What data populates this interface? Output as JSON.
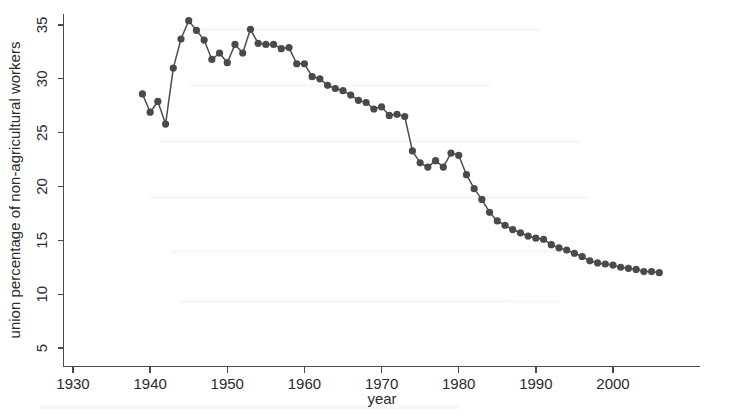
{
  "chart_data": {
    "type": "line",
    "title": "",
    "subtitle": "",
    "xlabel": "year",
    "ylabel": "union percentage of non-agricultural workers",
    "xlim": [
      1927,
      2008
    ],
    "ylim": [
      3.5,
      36.5
    ],
    "xticks": [
      1930,
      1940,
      1950,
      1960,
      1970,
      1980,
      1990,
      2000
    ],
    "yticks": [
      5,
      10,
      15,
      20,
      25,
      30,
      35
    ],
    "grid": false,
    "legend": null,
    "markers": "filled-circle",
    "marker_color": "#4a4a4a",
    "line_color": "#4d4d4d",
    "x": [
      1939,
      1940,
      1941,
      1942,
      1943,
      1944,
      1945,
      1946,
      1947,
      1948,
      1949,
      1950,
      1951,
      1952,
      1953,
      1954,
      1955,
      1956,
      1957,
      1958,
      1959,
      1960,
      1961,
      1962,
      1963,
      1964,
      1965,
      1966,
      1967,
      1968,
      1969,
      1970,
      1971,
      1972,
      1973,
      1974,
      1975,
      1976,
      1977,
      1978,
      1979,
      1980,
      1981,
      1982,
      1983,
      1984,
      1985,
      1986,
      1987,
      1988,
      1989,
      1990,
      1991,
      1992,
      1993,
      1994,
      1995,
      1996,
      1997,
      1998,
      1999,
      2000,
      2001,
      2002,
      2003,
      2004,
      2005,
      2006
    ],
    "y": [
      28.6,
      26.9,
      27.9,
      25.8,
      31.0,
      33.7,
      35.4,
      34.5,
      33.6,
      31.8,
      32.4,
      31.5,
      33.2,
      32.4,
      34.6,
      33.3,
      33.2,
      33.2,
      32.8,
      32.9,
      31.4,
      31.4,
      30.2,
      30.0,
      29.4,
      29.1,
      28.9,
      28.5,
      28.0,
      27.8,
      27.2,
      27.4,
      26.6,
      26.7,
      26.5,
      23.3,
      22.2,
      21.8,
      22.4,
      21.8,
      23.1,
      22.9,
      21.1,
      19.8,
      18.8,
      17.6,
      16.8,
      16.4,
      16.0,
      15.7,
      15.4,
      15.2,
      15.1,
      14.6,
      14.3,
      14.1,
      13.8,
      13.5,
      13.1,
      12.9,
      12.8,
      12.7,
      12.5,
      12.4,
      12.3,
      12.1,
      12.1,
      12.0
    ]
  },
  "axes": {
    "y_tick_labels": [
      "5",
      "10",
      "15",
      "20",
      "25",
      "30",
      "35"
    ],
    "x_tick_labels": [
      "1930",
      "1940",
      "1950",
      "1960",
      "1970",
      "1980",
      "1990",
      "2000"
    ],
    "x_axis_title": "year",
    "y_axis_title": "union percentage of non-agricultural workers"
  }
}
